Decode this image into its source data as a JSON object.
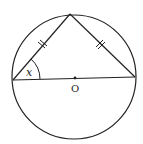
{
  "diagram": {
    "type": "geometry",
    "labels": {
      "angle": "x",
      "center": "O"
    },
    "stroke_color": "#222222",
    "background": "#ffffff",
    "circle": {
      "cx": 74,
      "cy": 77,
      "r": 62
    },
    "points": {
      "left": [
        13,
        80
      ],
      "right": [
        135,
        77
      ],
      "top": [
        70,
        14
      ],
      "center": [
        75,
        78
      ]
    },
    "equal_side_marks": 2
  }
}
